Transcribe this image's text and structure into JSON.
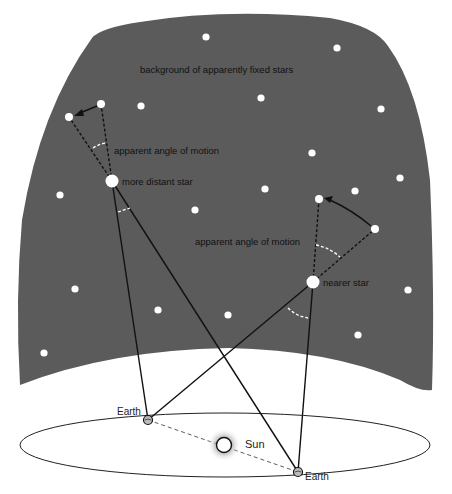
{
  "diagram": {
    "colors": {
      "sky": "#5b5b5b",
      "star": "#ffffff",
      "line": "#111111",
      "angle_arc": "#ffffff",
      "orbit": "#222222"
    },
    "labels": {
      "background": "background of apparently fixed stars",
      "angle_distant": "apparent angle of motion",
      "distant_star": "more distant star",
      "angle_near": "apparent angle of motion",
      "near_star": "nearer star",
      "earth_left": "Earth",
      "earth_right": "Earth",
      "sun": "Sun"
    },
    "background_stars": [
      {
        "x": 206,
        "y": 37
      },
      {
        "x": 337,
        "y": 48
      },
      {
        "x": 141,
        "y": 106
      },
      {
        "x": 261,
        "y": 98
      },
      {
        "x": 381,
        "y": 109
      },
      {
        "x": 312,
        "y": 153
      },
      {
        "x": 400,
        "y": 178
      },
      {
        "x": 60,
        "y": 195
      },
      {
        "x": 265,
        "y": 189
      },
      {
        "x": 355,
        "y": 191
      },
      {
        "x": 195,
        "y": 210
      },
      {
        "x": 75,
        "y": 289
      },
      {
        "x": 158,
        "y": 310
      },
      {
        "x": 228,
        "y": 315
      },
      {
        "x": 408,
        "y": 290
      },
      {
        "x": 358,
        "y": 335
      },
      {
        "x": 44,
        "y": 353
      }
    ],
    "distant_star": {
      "x": 112,
      "y": 181,
      "apparent_positions": [
        {
          "x": 101,
          "y": 104
        },
        {
          "x": 69,
          "y": 117
        }
      ]
    },
    "near_star": {
      "x": 313,
      "y": 282,
      "apparent_positions": [
        {
          "x": 375,
          "y": 229
        },
        {
          "x": 319,
          "y": 199
        }
      ]
    },
    "earth_positions": [
      {
        "x": 148,
        "y": 420
      },
      {
        "x": 298,
        "y": 472
      }
    ],
    "sun": {
      "x": 224,
      "y": 445
    }
  }
}
